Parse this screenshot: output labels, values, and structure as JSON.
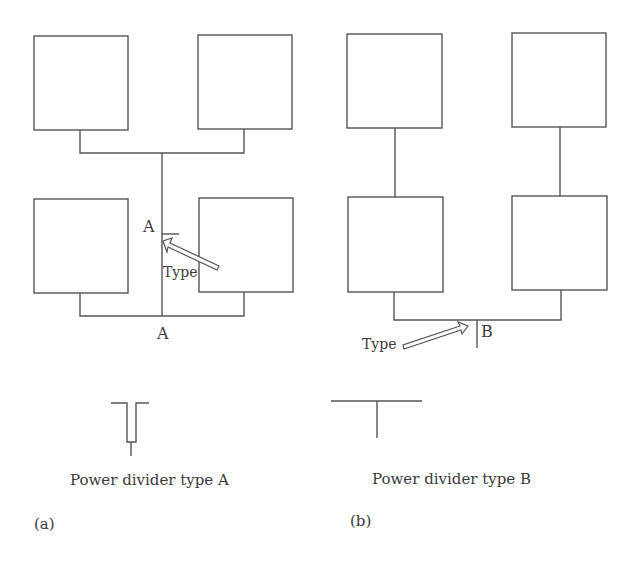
{
  "figure": {
    "panel_a": {
      "tag": "(a)",
      "junction_label_top": "A",
      "junction_label_bottom": "A",
      "type_label": "Type",
      "caption": "Power divider type A",
      "elements": 4
    },
    "panel_b": {
      "tag": "(b)",
      "junction_label": "B",
      "type_label": "Type",
      "caption": "Power divider type B",
      "elements": 4
    },
    "colors": {
      "line": "#555555",
      "text": "#3a3a3a",
      "background": "#ffffff"
    }
  }
}
